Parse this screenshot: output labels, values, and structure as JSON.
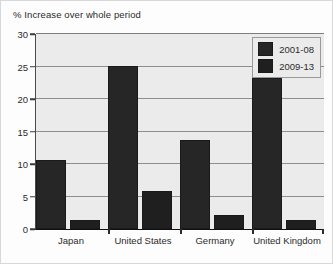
{
  "chart_data": {
    "type": "bar",
    "title": "% Increase over whole period",
    "xlabel": "",
    "ylabel": "",
    "ylim": [
      0,
      30
    ],
    "yticks": [
      0,
      5,
      10,
      15,
      20,
      25,
      30
    ],
    "grid": true,
    "legend_position": "top-right",
    "categories": [
      "Japan",
      "United States",
      "Germany",
      "United Kingdom"
    ],
    "series": [
      {
        "name": "2001-08",
        "values": [
          10.6,
          25.1,
          13.7,
          23.3
        ],
        "color": "#262626"
      },
      {
        "name": "2009-13",
        "values": [
          1.4,
          5.8,
          2.1,
          1.4
        ],
        "color": "#1f1f1f"
      }
    ]
  },
  "figure": {
    "background": "#fdfdfd",
    "plot_background": "#ebebeb",
    "gridline_color": "#8e8e8e",
    "axis_color": "#111111",
    "text_color": "#2b2b2b"
  }
}
